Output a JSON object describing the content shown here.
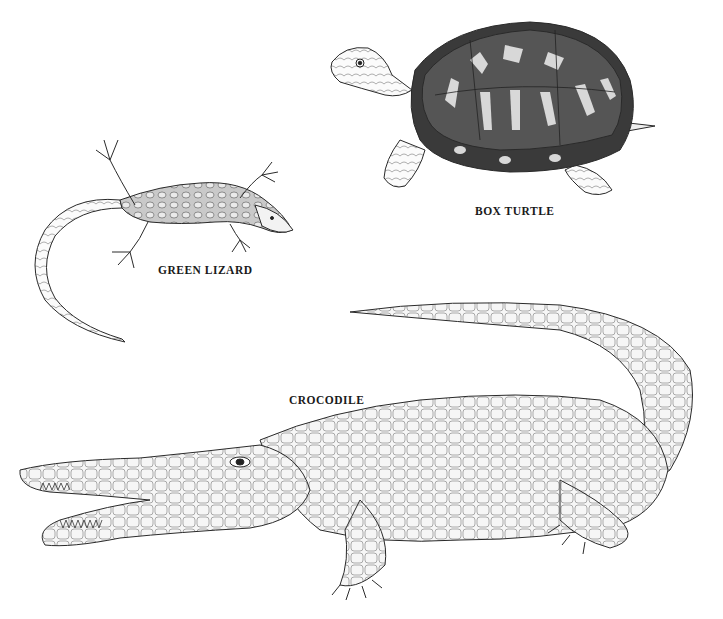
{
  "illustration": {
    "subjects": [
      {
        "id": "green-lizard",
        "label": "GREEN LIZARD"
      },
      {
        "id": "box-turtle",
        "label": "BOX TURTLE"
      },
      {
        "id": "crocodile",
        "label": "CROCODILE"
      }
    ],
    "style": "pencil sketch, black and white",
    "colors": {
      "background": "#ffffff",
      "ink": "#1a1a1a",
      "shell_dark": "#3a3a3a",
      "shell_light": "#d8d8d8"
    }
  }
}
